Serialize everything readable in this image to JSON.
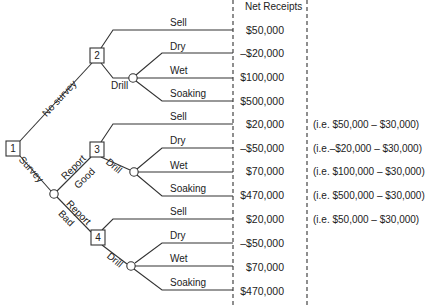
{
  "header": {
    "net_receipts": "Net Receipts"
  },
  "nodes": {
    "n1": "1",
    "n2": "2",
    "n3": "3",
    "n4": "4"
  },
  "edges": {
    "no_survey": "No survey",
    "survey": "Survey",
    "report_good_1": "Report",
    "report_good_2": "Good",
    "report_bad_1": "Report",
    "report_bad_2": "Bad",
    "drill_2": "Drill",
    "drill_3": "Drill",
    "drill_4": "Drill"
  },
  "branches": [
    {
      "label": "Sell",
      "value": "$50,000",
      "note": ""
    },
    {
      "label": "Dry",
      "value": "–$20,000",
      "note": ""
    },
    {
      "label": "Wet",
      "value": "$100,000",
      "note": ""
    },
    {
      "label": "Soaking",
      "value": "$500,000",
      "note": ""
    },
    {
      "label": "Sell",
      "value": "$20,000",
      "note": "(i.e. $50,000 – $30,000)"
    },
    {
      "label": "Dry",
      "value": "–$50,000",
      "note": "(i.e.–$20,000 – $30,000)"
    },
    {
      "label": "Wet",
      "value": "$70,000",
      "note": "(i.e. $100,000 – $30,000)"
    },
    {
      "label": "Soaking",
      "value": "$470,000",
      "note": "(i.e. $500,000 – $30,000)"
    },
    {
      "label": "Sell",
      "value": "$20,000",
      "note": "(i.e. $50,000 – $30,000)"
    },
    {
      "label": "Dry",
      "value": "–$50,000",
      "note": ""
    },
    {
      "label": "Wet",
      "value": "$70,000",
      "note": ""
    },
    {
      "label": "Soaking",
      "value": "$470,000",
      "note": ""
    }
  ]
}
